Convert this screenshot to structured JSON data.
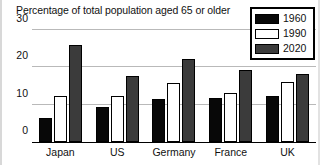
{
  "chart_data": {
    "type": "bar",
    "title": "Percentage of total population aged 65 or older",
    "xlabel": "",
    "ylabel": "",
    "ylim": [
      0,
      30
    ],
    "yticks": [
      0,
      10,
      20,
      30
    ],
    "grid": true,
    "legend_position": "top-right",
    "categories": [
      "Japan",
      "US",
      "Germany",
      "France",
      "UK"
    ],
    "series": [
      {
        "name": "1960",
        "color": "#080808",
        "values": [
          6.3,
          9.3,
          11.4,
          11.8,
          12.3
        ]
      },
      {
        "name": "1990",
        "color": "#ffffff",
        "values": [
          12.2,
          12.3,
          15.8,
          13.2,
          16.1
        ]
      },
      {
        "name": "2020",
        "color": "#3b3b3b",
        "values": [
          26.0,
          17.8,
          22.3,
          19.3,
          18.3
        ]
      }
    ]
  },
  "axis": {
    "tick_0": "0",
    "tick_1": "10",
    "tick_2": "20",
    "tick_3": "30"
  },
  "legend": {
    "entries": [
      {
        "label": "1960"
      },
      {
        "label": "1990"
      },
      {
        "label": "2020"
      }
    ]
  }
}
